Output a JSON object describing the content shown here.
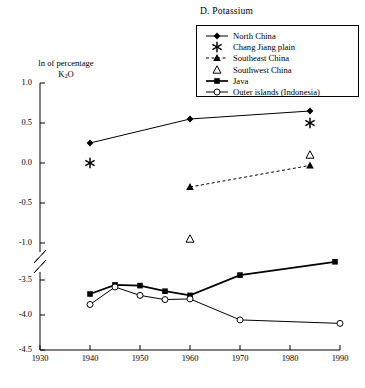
{
  "panel": {
    "title": "D. Potassium"
  },
  "axes": {
    "ylabel_line1": "ln of percentage",
    "ylabel_line2_main": "K",
    "ylabel_line2_sub": "2",
    "ylabel_line2_tail": "O",
    "y_ticks": [
      "1.0",
      "0.5",
      "0.0",
      "-0.5",
      "-1.0",
      "-3.5",
      "-4.0",
      "-4.5"
    ],
    "y_tick_values": [
      1.0,
      0.5,
      0.0,
      -0.5,
      -1.0,
      -3.5,
      -4.0,
      -4.5
    ],
    "x_ticks": [
      "1930",
      "1940",
      "1950",
      "1960",
      "1970",
      "1980",
      "1990"
    ],
    "x_tick_values": [
      1930,
      1940,
      1950,
      1960,
      1970,
      1980,
      1990
    ],
    "has_axis_break": true,
    "break_between": [
      -1.0,
      -3.5
    ],
    "grid": false
  },
  "legend": {
    "position": "top-right",
    "items": [
      {
        "label": "North China",
        "marker": "filled-diamond",
        "line": "solid",
        "key_name": "legend-key-north-china"
      },
      {
        "label": "Chang Jiang plain",
        "marker": "asterisk",
        "line": "none",
        "key_name": "legend-key-chang-jiang-plain"
      },
      {
        "label": "Southeast China",
        "marker": "filled-triangle",
        "line": "dashed",
        "key_name": "legend-key-southeast-china"
      },
      {
        "label": "Southwest China",
        "marker": "open-triangle",
        "line": "none",
        "key_name": "legend-key-southwest-china"
      },
      {
        "label": "Java",
        "marker": "filled-square",
        "line": "solid-thick",
        "key_name": "legend-key-java"
      },
      {
        "label": "Outer islands (Indonesia)",
        "marker": "open-circle",
        "line": "solid",
        "key_name": "legend-key-outer-islands"
      }
    ]
  },
  "chart_data": {
    "type": "line",
    "title": "D. Potassium",
    "xlabel": "",
    "ylabel": "ln of percentage K2O",
    "xlim": [
      1930,
      1990
    ],
    "ylim": [
      -4.5,
      1.0
    ],
    "y_break": [
      -1.0,
      -3.5
    ],
    "grid": false,
    "legend_position": "top-right",
    "series": [
      {
        "name": "North China",
        "marker": "filled-diamond",
        "line": "solid",
        "points": [
          {
            "x": 1940,
            "y": 0.25
          },
          {
            "x": 1960,
            "y": 0.55
          },
          {
            "x": 1984,
            "y": 0.65
          }
        ]
      },
      {
        "name": "Chang Jiang plain",
        "marker": "asterisk",
        "line": "none",
        "points": [
          {
            "x": 1940,
            "y": 0.0
          },
          {
            "x": 1984,
            "y": 0.5
          }
        ]
      },
      {
        "name": "Southeast China",
        "marker": "filled-triangle",
        "line": "dashed",
        "points": [
          {
            "x": 1960,
            "y": -0.3
          },
          {
            "x": 1984,
            "y": -0.03
          }
        ]
      },
      {
        "name": "Southwest China",
        "marker": "open-triangle",
        "line": "none",
        "points": [
          {
            "x": 1960,
            "y": -0.95
          },
          {
            "x": 1984,
            "y": 0.1
          }
        ]
      },
      {
        "name": "Java",
        "marker": "filled-square",
        "line": "solid-thick",
        "points": [
          {
            "x": 1940,
            "y": -3.7
          },
          {
            "x": 1945,
            "y": -3.57
          },
          {
            "x": 1950,
            "y": -3.58
          },
          {
            "x": 1955,
            "y": -3.66
          },
          {
            "x": 1960,
            "y": -3.72
          },
          {
            "x": 1970,
            "y": -3.43
          },
          {
            "x": 1989,
            "y": -3.24
          }
        ]
      },
      {
        "name": "Outer islands (Indonesia)",
        "marker": "open-circle",
        "line": "solid",
        "points": [
          {
            "x": 1940,
            "y": -3.85
          },
          {
            "x": 1945,
            "y": -3.6
          },
          {
            "x": 1950,
            "y": -3.72
          },
          {
            "x": 1955,
            "y": -3.78
          },
          {
            "x": 1960,
            "y": -3.77
          },
          {
            "x": 1970,
            "y": -4.07
          },
          {
            "x": 1990,
            "y": -4.12
          }
        ]
      }
    ]
  }
}
